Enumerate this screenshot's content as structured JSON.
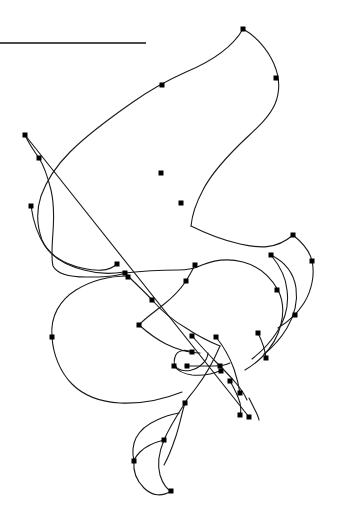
{
  "canvas": {
    "width": 337,
    "height": 520,
    "background_color": "#ffffff",
    "stroke_color": "#1a1a1a",
    "node_color": "#000000",
    "node_size": 5,
    "stroke_width": 1.1
  },
  "rule": {
    "name": "horizontal-rule",
    "x1": 0,
    "y1": 43,
    "x2": 146,
    "y2": 43,
    "color": "#101010",
    "width": 1.6
  },
  "paths": [
    {
      "id": "path-main-s-curve",
      "label": "main-s-curve",
      "d": "M 243 29 C 232 48 210 62 186 72 C 168 80 150 90 133 102 C 110 118 88 134 70 152 C 56 166 46 182 41 196 C 36 211 37 226 42 240 C 48 254 63 264 82 268 C 96 271 108 272 117 264"
    },
    {
      "id": "path-right-hook",
      "label": "upper-right-hook",
      "d": "M 243 29 C 256 36 268 50 274 64 C 280 78 280 92 275 104 C 268 120 252 132 238 146 C 224 160 211 174 203 190 C 196 203 192 215 191 226"
    },
    {
      "id": "path-left-descent",
      "label": "left-descent-branch",
      "d": "M 25 135 C 30 146 35 152 39 158 C 44 166 48 178 51 190 C 54 203 54 218 53 232 C 52 246 51 258 53 266 C 57 274 70 277 86 277 C 100 277 114 277 125 273"
    },
    {
      "id": "path-long-diagonal",
      "label": "long-diagonal-crossing",
      "d": "M 25 135 L 249 417"
    },
    {
      "id": "path-mid-left-hump",
      "label": "mid-left-hump",
      "d": "M 31 206 C 33 220 37 234 45 246 C 53 258 68 266 84 270 C 98 274 112 274 124 272"
    },
    {
      "id": "path-mid-right-run",
      "label": "mid-right-run",
      "d": "M 125 273 C 142 271 160 270 178 270 C 190 270 196 268 202 265 C 214 260 228 258 243 262 C 258 266 270 276 278 290"
    },
    {
      "id": "path-right-arc-1",
      "label": "right-arc-outer",
      "d": "M 191 226 C 205 233 222 240 240 244 C 258 248 276 250 293 235"
    },
    {
      "id": "path-right-arc-2",
      "label": "right-arc-second",
      "d": "M 293 235 C 303 243 310 252 312 261 C 315 274 312 290 304 303 C 297 314 288 322 278 328"
    },
    {
      "id": "path-right-arc-3",
      "label": "right-arc-third",
      "d": "M 271 255 C 285 262 294 274 296 288 C 298 302 294 316 287 328 C 281 338 273 347 264 354"
    },
    {
      "id": "path-right-arc-4",
      "label": "right-arc-fourth",
      "d": "M 271 255 C 280 266 286 278 287 290 C 289 305 285 320 277 332 C 270 343 261 352 252 359"
    },
    {
      "id": "path-right-arc-5",
      "label": "right-arc-fifth",
      "d": "M 278 290 C 283 300 284 312 281 324 C 278 337 271 348 262 357 C 256 363 250 367 245 370"
    },
    {
      "id": "path-big-left-loop",
      "label": "big-left-loop",
      "d": "M 128 276 C 110 276 92 280 76 290 C 60 300 50 316 52 337 C 53 354 60 372 72 384 C 84 396 101 402 120 403 C 140 404 162 400 182 392"
    },
    {
      "id": "path-inner-v",
      "label": "inner-v-crossing",
      "d": "M 128 276 C 138 286 148 295 152 300 C 160 309 172 320 186 328 C 198 336 210 342 220 346"
    },
    {
      "id": "path-mid-hook-upper",
      "label": "mid-hook-upper",
      "d": "M 195 265 C 192 271 189 276 186 281 C 180 290 172 298 163 305 C 153 313 144 319 139 325"
    },
    {
      "id": "path-lower-left-tail",
      "label": "lower-left-tail",
      "d": "M 139 325 C 147 332 156 339 166 344 C 178 350 190 353 200 353"
    },
    {
      "id": "path-small-spiral",
      "label": "small-spiral-hook",
      "d": "M 192 352 C 185 349 177 350 175 357 C 173 363 175 368 181 370 C 187 372 195 370 200 366 C 205 362 208 357 208 353"
    },
    {
      "id": "path-spiral-tail",
      "label": "spiral-tail",
      "d": "M 174 366 C 178 371 184 374 192 375 C 202 376 213 374 222 370"
    },
    {
      "id": "path-hook-bar",
      "label": "hook-bar",
      "d": "M 187 366 C 196 366 206 366 214 366 C 220 366 226 365 230 363"
    },
    {
      "id": "path-node-cluster-down",
      "label": "node-cluster-descent",
      "d": "M 192 336 C 200 345 208 354 216 362 C 223 369 230 376 235 382 C 241 389 245 395 247 400"
    },
    {
      "id": "path-tail-right-1",
      "label": "tail-right-short",
      "d": "M 216 337 C 224 347 230 358 234 369 C 237 378 239 387 240 393"
    },
    {
      "id": "path-tail-right-2",
      "label": "tail-right-drop",
      "d": "M 230 381 C 234 388 238 396 240 403 C 241 408 241 412 240 415"
    },
    {
      "id": "path-bottom-serpent",
      "label": "bottom-serpentine",
      "d": "M 220 346 C 214 360 206 375 196 388 C 190 396 186 400 185 403 C 182 412 180 424 176 436 C 172 448 168 458 164 465"
    },
    {
      "id": "path-bottom-s",
      "label": "bottom-s-curve",
      "d": "M 185 403 C 178 414 170 426 164 440 C 159 452 157 464 160 475 C 163 485 168 490 171 491"
    },
    {
      "id": "path-bottom-left-wave",
      "label": "bottom-left-wave",
      "d": "M 164 440 C 156 442 146 446 140 452 C 134 458 132 464 134 461 C 133 470 136 480 144 488 C 152 496 162 497 171 491"
    },
    {
      "id": "path-left-descender",
      "label": "left-descender",
      "d": "M 134 461 C 132 452 133 444 136 438 C 140 430 148 424 157 420 C 165 416 173 414 179 413"
    },
    {
      "id": "path-far-bottom-tail",
      "label": "far-bottom-tail",
      "d": "M 249 398 C 252 404 255 410 257 414 C 258 417 259 419 259 420"
    },
    {
      "id": "path-stub-right",
      "label": "right-stub",
      "d": "M 258 333 C 262 341 265 350 266 358"
    }
  ],
  "nodes": [
    {
      "id": "n1",
      "label": "node-apex-top",
      "x": 243,
      "y": 29
    },
    {
      "id": "n2",
      "label": "node-upper-right",
      "x": 276,
      "y": 78
    },
    {
      "id": "n3",
      "label": "node-upper-mid",
      "x": 162,
      "y": 85
    },
    {
      "id": "n4",
      "label": "node-left-upper",
      "x": 25,
      "y": 135
    },
    {
      "id": "n5",
      "label": "node-left-junction",
      "x": 39,
      "y": 158
    },
    {
      "id": "n6",
      "label": "node-right-bend",
      "x": 161,
      "y": 173
    },
    {
      "id": "n7",
      "label": "node-right-lower-bend",
      "x": 181,
      "y": 203
    },
    {
      "id": "n8",
      "label": "node-left-mid",
      "x": 31,
      "y": 206
    },
    {
      "id": "n9",
      "label": "node-right-far",
      "x": 293,
      "y": 235
    },
    {
      "id": "n10",
      "label": "node-arc-top",
      "x": 271,
      "y": 255
    },
    {
      "id": "n11",
      "label": "node-center-upper",
      "x": 117,
      "y": 264
    },
    {
      "id": "n12",
      "label": "node-arc-outer",
      "x": 312,
      "y": 261
    },
    {
      "id": "n13",
      "label": "node-center-bar-right",
      "x": 195,
      "y": 265
    },
    {
      "id": "n14",
      "label": "node-center-lower",
      "x": 125,
      "y": 273
    },
    {
      "id": "n15",
      "label": "node-center-base",
      "x": 128,
      "y": 277
    },
    {
      "id": "n16",
      "label": "node-bar-end",
      "x": 186,
      "y": 281
    },
    {
      "id": "n17",
      "label": "node-arc-mid",
      "x": 277,
      "y": 290
    },
    {
      "id": "n18",
      "label": "node-v-apex",
      "x": 152,
      "y": 300
    },
    {
      "id": "n19",
      "label": "node-arc-lower",
      "x": 295,
      "y": 315
    },
    {
      "id": "n20",
      "label": "node-left-loop-edge",
      "x": 52,
      "y": 337
    },
    {
      "id": "n21",
      "label": "node-v-left",
      "x": 139,
      "y": 325
    },
    {
      "id": "n22",
      "label": "node-arc-end",
      "x": 258,
      "y": 333
    },
    {
      "id": "n23",
      "label": "node-cluster-top",
      "x": 192,
      "y": 336
    },
    {
      "id": "n24",
      "label": "node-cluster-right",
      "x": 216,
      "y": 337
    },
    {
      "id": "n25",
      "label": "node-spiral-top",
      "x": 192,
      "y": 352
    },
    {
      "id": "n26",
      "label": "node-spiral-left",
      "x": 174,
      "y": 366
    },
    {
      "id": "n27",
      "label": "node-spiral-inner",
      "x": 187,
      "y": 366
    },
    {
      "id": "n28",
      "label": "node-hook-right",
      "x": 220,
      "y": 366
    },
    {
      "id": "n29",
      "label": "node-cluster-mid",
      "x": 230,
      "y": 381
    },
    {
      "id": "n30",
      "label": "node-cluster-low",
      "x": 240,
      "y": 393
    },
    {
      "id": "n31",
      "label": "node-serpent-start",
      "x": 221,
      "y": 371
    },
    {
      "id": "n32",
      "label": "node-diagonal-end",
      "x": 249,
      "y": 417
    },
    {
      "id": "n33",
      "label": "node-tail-bottom",
      "x": 240,
      "y": 415
    },
    {
      "id": "n34",
      "label": "node-serpent-upper",
      "x": 185,
      "y": 403
    },
    {
      "id": "n35",
      "label": "node-wave-left",
      "x": 134,
      "y": 461
    },
    {
      "id": "n36",
      "label": "node-wave-mid",
      "x": 164,
      "y": 440
    },
    {
      "id": "n37",
      "label": "node-wave-bottom",
      "x": 171,
      "y": 491
    },
    {
      "id": "n38",
      "label": "node-right-tail-tip",
      "x": 266,
      "y": 358
    }
  ]
}
